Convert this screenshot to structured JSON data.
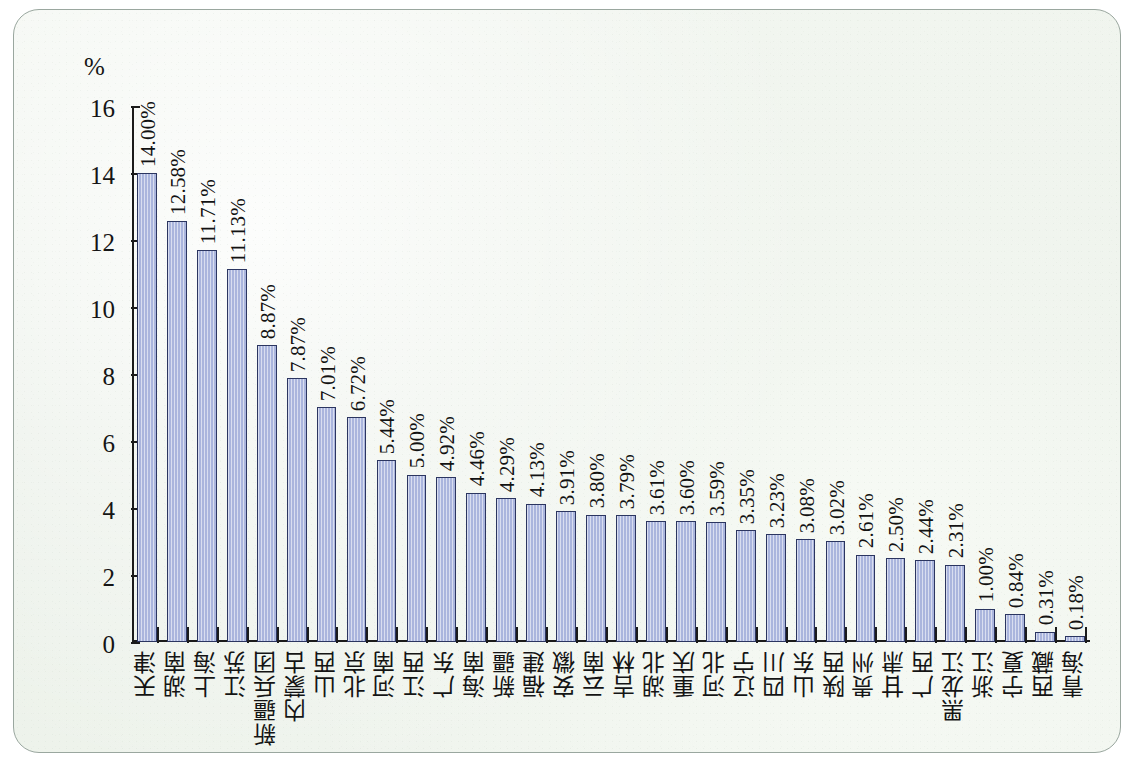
{
  "figure": {
    "unit_label": "%",
    "background_color": "#eef3ec",
    "bar_fill_color": "#aab5dd",
    "bar_border_color": "#2b3560",
    "axis_color": "#1b1b1b"
  },
  "chart_data": {
    "type": "bar",
    "title": "",
    "subtitle": "",
    "xlabel": "",
    "ylabel": "%",
    "ylim": [
      0,
      16
    ],
    "ytick_labels": [
      "0",
      "2",
      "4",
      "6",
      "8",
      "10",
      "12",
      "14",
      "16"
    ],
    "yticks": [
      0,
      2,
      4,
      6,
      8,
      10,
      12,
      14,
      16
    ],
    "grid": false,
    "legend": null,
    "categories": [
      "天津",
      "湖南",
      "上海",
      "江苏",
      "新疆兵团",
      "内蒙古",
      "山西",
      "北京",
      "河南",
      "江西",
      "广东",
      "海南",
      "新疆",
      "福建",
      "安徽",
      "云南",
      "吉林",
      "湖北",
      "重庆",
      "河北",
      "辽宁",
      "四川",
      "山东",
      "陕西",
      "贵州",
      "甘肃",
      "广西",
      "黑龙江",
      "浙江",
      "宁夏",
      "西藏",
      "青海"
    ],
    "values": [
      14.0,
      12.58,
      11.71,
      11.13,
      8.87,
      7.87,
      7.01,
      6.72,
      5.44,
      5.0,
      4.92,
      4.46,
      4.29,
      4.13,
      3.91,
      3.8,
      3.79,
      3.61,
      3.6,
      3.59,
      3.35,
      3.23,
      3.08,
      3.02,
      2.61,
      2.5,
      2.44,
      2.31,
      1.0,
      0.84,
      0.31,
      0.18
    ],
    "value_labels": [
      "14.00%",
      "12.58%",
      "11.71%",
      "11.13%",
      "8.87%",
      "7.87%",
      "7.01%",
      "6.72%",
      "5.44%",
      "5.00%",
      "4.92%",
      "4.46%",
      "4.29%",
      "4.13%",
      "3.91%",
      "3.80%",
      "3.79%",
      "3.61%",
      "3.60%",
      "3.59%",
      "3.35%",
      "3.23%",
      "3.08%",
      "3.02%",
      "2.61%",
      "2.50%",
      "2.44%",
      "2.31%",
      "1.00%",
      "0.84%",
      "0.31%",
      "0.18%"
    ]
  }
}
